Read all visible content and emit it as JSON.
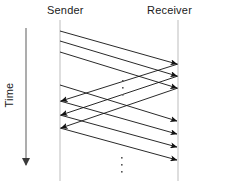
{
  "diagram": {
    "type": "sequence-timing-diagram",
    "title_sender": "Sender",
    "title_receiver": "Receiver",
    "axis_label_time": "Time",
    "colors": {
      "line": "#111111",
      "lifeline": "#bdbdbd",
      "axis": "#8a8a8a",
      "background": "#ffffff",
      "text": "#1a1a1a"
    },
    "lifelines": [
      {
        "name": "sender",
        "x": 60,
        "y1": 20,
        "y2": 181
      },
      {
        "name": "receiver",
        "x": 178,
        "y1": 20,
        "y2": 181
      }
    ],
    "time_axis": {
      "x": 26,
      "y1": 28,
      "y2": 171,
      "direction": "down"
    },
    "ellipses": [
      {
        "name": "middle-ellipsis",
        "x": 122,
        "y": 80,
        "dots": 3
      },
      {
        "name": "bottom-ellipsis",
        "x": 121,
        "y": 157,
        "dots": 3
      }
    ],
    "messages": [
      {
        "id": "m1",
        "direction": "sender-to-receiver",
        "x1": 60,
        "y1": 31,
        "x2": 177,
        "y2": 64
      },
      {
        "id": "m2",
        "direction": "sender-to-receiver",
        "x1": 60,
        "y1": 41,
        "x2": 177,
        "y2": 76
      },
      {
        "id": "m3",
        "direction": "sender-to-receiver",
        "x1": 60,
        "y1": 52,
        "x2": 177,
        "y2": 88
      },
      {
        "id": "a1",
        "direction": "receiver-to-sender",
        "x1": 178,
        "y1": 64,
        "x2": 61,
        "y2": 101
      },
      {
        "id": "a2",
        "direction": "receiver-to-sender",
        "x1": 178,
        "y1": 76,
        "x2": 61,
        "y2": 115
      },
      {
        "id": "a3",
        "direction": "receiver-to-sender",
        "x1": 178,
        "y1": 88,
        "x2": 61,
        "y2": 128
      },
      {
        "id": "m4",
        "direction": "sender-to-receiver",
        "x1": 60,
        "y1": 85,
        "x2": 177,
        "y2": 121
      },
      {
        "id": "m5",
        "direction": "sender-to-receiver",
        "x1": 60,
        "y1": 101,
        "x2": 177,
        "y2": 134
      },
      {
        "id": "m6",
        "direction": "sender-to-receiver",
        "x1": 60,
        "y1": 115,
        "x2": 177,
        "y2": 147
      },
      {
        "id": "m7",
        "direction": "sender-to-receiver",
        "x1": 60,
        "y1": 128,
        "x2": 177,
        "y2": 160
      }
    ]
  }
}
